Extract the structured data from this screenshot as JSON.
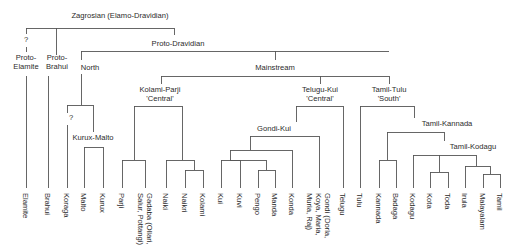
{
  "diagram": {
    "type": "language-family-tree",
    "colors": {
      "line": "#555555",
      "text": "#2b2b2b",
      "background": "#ffffff"
    },
    "internal_nodes": [
      {
        "id": "zagrosian",
        "lines": [
          "Zagrosian (Elamo-Dravidian)"
        ],
        "x": 120,
        "y": 18
      },
      {
        "id": "q1",
        "lines": [
          "?"
        ],
        "x": 26,
        "y": 42
      },
      {
        "id": "proto-elamite",
        "lines": [
          "Proto-",
          "Elamite"
        ],
        "x": 26,
        "y": 60
      },
      {
        "id": "proto-brahui",
        "lines": [
          "Proto-",
          "Brahui"
        ],
        "x": 57,
        "y": 60
      },
      {
        "id": "proto-dravidian",
        "lines": [
          "Proto-Dravidian"
        ],
        "x": 178,
        "y": 46
      },
      {
        "id": "north",
        "lines": [
          "North"
        ],
        "x": 90,
        "y": 70
      },
      {
        "id": "mainstream",
        "lines": [
          "Mainstream"
        ],
        "x": 275,
        "y": 70
      },
      {
        "id": "kolami-parji",
        "lines": [
          "Kolami-Parji",
          "'Central'"
        ],
        "x": 160,
        "y": 92
      },
      {
        "id": "telugu-kui",
        "lines": [
          "Telugu-Kui",
          "'Central'"
        ],
        "x": 320,
        "y": 92
      },
      {
        "id": "tamil-tulu",
        "lines": [
          "Tamil-Tulu",
          "'South'"
        ],
        "x": 389,
        "y": 92
      },
      {
        "id": "q2",
        "lines": [
          "?"
        ],
        "x": 71,
        "y": 120
      },
      {
        "id": "kurux-malto",
        "lines": [
          "Kurux-Malto"
        ],
        "x": 93,
        "y": 140
      },
      {
        "id": "gondi-kui",
        "lines": [
          "Gondi-Kui"
        ],
        "x": 274,
        "y": 131
      },
      {
        "id": "tamil-kannada",
        "lines": [
          "Tamil-Kannada"
        ],
        "x": 447,
        "y": 126
      },
      {
        "id": "tamil-kodagu",
        "lines": [
          "Tamil-Kodagu"
        ],
        "x": 473,
        "y": 149
      }
    ],
    "leaves": [
      {
        "lines": [
          "Elamite"
        ],
        "x": 26
      },
      {
        "lines": [
          "Brahui"
        ],
        "x": 48
      },
      {
        "lines": [
          "Koraga"
        ],
        "x": 67
      },
      {
        "lines": [
          "Malto"
        ],
        "x": 84
      },
      {
        "lines": [
          "Kurux"
        ],
        "x": 103
      },
      {
        "lines": [
          "Parji"
        ],
        "x": 122
      },
      {
        "lines": [
          "Gadaba (Ollari,",
          "Salur, Pottangi)"
        ],
        "x": 145
      },
      {
        "lines": [
          "Naiki"
        ],
        "x": 166
      },
      {
        "lines": [
          "Naikri"
        ],
        "x": 185
      },
      {
        "lines": [
          "Kolami"
        ],
        "x": 203
      },
      {
        "lines": [
          "Kui"
        ],
        "x": 221
      },
      {
        "lines": [
          "Kuvi"
        ],
        "x": 240
      },
      {
        "lines": [
          "Pengo"
        ],
        "x": 258
      },
      {
        "lines": [
          "Manda"
        ],
        "x": 275
      },
      {
        "lines": [
          "Konda"
        ],
        "x": 292
      },
      {
        "lines": [
          "Gondi (Dorla,",
          "Koya, Maria,",
          "Muria, Raj)"
        ],
        "x": 319
      },
      {
        "lines": [
          "Telugu"
        ],
        "x": 343
      },
      {
        "lines": [
          "Tulu"
        ],
        "x": 360
      },
      {
        "lines": [
          "Kannada"
        ],
        "x": 379
      },
      {
        "lines": [
          "Badaga"
        ],
        "x": 396
      },
      {
        "lines": [
          "Kodagu"
        ],
        "x": 413
      },
      {
        "lines": [
          "Kota"
        ],
        "x": 430
      },
      {
        "lines": [
          "Toda"
        ],
        "x": 448
      },
      {
        "lines": [
          "Irula"
        ],
        "x": 465
      },
      {
        "lines": [
          "Malayalam"
        ],
        "x": 483
      },
      {
        "lines": [
          "Tamil"
        ],
        "x": 500
      }
    ],
    "edges": [
      [
        26,
        28,
        174,
        28
      ],
      [
        26,
        28,
        26,
        34
      ],
      [
        26,
        47,
        26,
        52
      ],
      [
        56,
        28,
        56,
        55
      ],
      [
        174,
        28,
        174,
        35
      ],
      [
        26,
        76,
        26,
        188
      ],
      [
        48,
        76,
        48,
        188
      ],
      [
        81,
        51,
        389,
        51
      ],
      [
        81,
        51,
        81,
        60
      ],
      [
        275,
        51,
        275,
        60
      ],
      [
        81,
        74,
        81,
        105
      ],
      [
        67,
        105,
        93,
        105
      ],
      [
        67,
        105,
        67,
        113
      ],
      [
        67,
        125,
        67,
        188
      ],
      [
        93,
        105,
        93,
        132
      ],
      [
        84,
        147,
        103,
        147
      ],
      [
        84,
        147,
        84,
        188
      ],
      [
        103,
        147,
        103,
        188
      ],
      [
        161,
        76,
        389,
        76
      ],
      [
        161,
        76,
        161,
        84
      ],
      [
        320,
        76,
        320,
        84
      ],
      [
        389,
        76,
        389,
        84
      ],
      [
        134,
        106,
        182,
        106
      ],
      [
        134,
        106,
        134,
        160
      ],
      [
        182,
        106,
        182,
        160
      ],
      [
        122,
        160,
        145,
        160
      ],
      [
        122,
        160,
        122,
        188
      ],
      [
        145,
        160,
        145,
        188
      ],
      [
        166,
        160,
        194,
        160
      ],
      [
        166,
        160,
        166,
        188
      ],
      [
        194,
        160,
        194,
        170
      ],
      [
        185,
        170,
        203,
        170
      ],
      [
        185,
        170,
        185,
        188
      ],
      [
        203,
        170,
        203,
        188
      ],
      [
        296,
        106,
        343,
        106
      ],
      [
        296,
        106,
        296,
        122
      ],
      [
        343,
        106,
        343,
        188
      ],
      [
        250,
        136,
        319,
        136
      ],
      [
        250,
        136,
        250,
        150
      ],
      [
        319,
        136,
        319,
        188
      ],
      [
        230,
        150,
        292,
        150
      ],
      [
        230,
        150,
        230,
        160
      ],
      [
        292,
        150,
        292,
        188
      ],
      [
        230,
        160,
        266,
        160
      ],
      [
        266,
        160,
        266,
        170
      ],
      [
        230,
        160,
        230,
        160
      ],
      [
        221,
        160,
        240,
        160
      ],
      [
        221,
        160,
        221,
        188
      ],
      [
        240,
        160,
        240,
        188
      ],
      [
        258,
        170,
        275,
        170
      ],
      [
        258,
        170,
        258,
        188
      ],
      [
        275,
        170,
        275,
        188
      ],
      [
        360,
        106,
        414,
        106
      ],
      [
        360,
        106,
        360,
        188
      ],
      [
        414,
        106,
        414,
        118
      ],
      [
        387,
        132,
        444,
        132
      ],
      [
        387,
        132,
        387,
        160
      ],
      [
        444,
        132,
        444,
        141
      ],
      [
        379,
        160,
        396,
        160
      ],
      [
        379,
        160,
        379,
        188
      ],
      [
        396,
        160,
        396,
        188
      ],
      [
        413,
        155,
        476,
        155
      ],
      [
        413,
        155,
        413,
        188
      ],
      [
        439,
        155,
        439,
        172
      ],
      [
        476,
        155,
        476,
        166
      ],
      [
        430,
        172,
        448,
        172
      ],
      [
        430,
        172,
        430,
        188
      ],
      [
        448,
        172,
        448,
        188
      ],
      [
        465,
        166,
        490,
        166
      ],
      [
        465,
        166,
        465,
        188
      ],
      [
        490,
        166,
        490,
        174
      ],
      [
        483,
        174,
        500,
        174
      ],
      [
        483,
        174,
        483,
        188
      ],
      [
        500,
        174,
        500,
        188
      ]
    ],
    "leaf_label_top": 193,
    "line_height": 9
  }
}
